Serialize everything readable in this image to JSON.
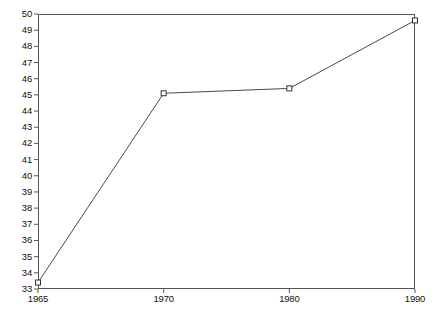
{
  "chart_data": {
    "type": "line",
    "title": "",
    "subtitle": "",
    "xlabel": "",
    "ylabel": "",
    "categories": [
      "1965",
      "1970",
      "1980",
      "1990"
    ],
    "x": [
      1965,
      1970,
      1980,
      1990
    ],
    "values": [
      33.4,
      45.1,
      45.4,
      49.6
    ],
    "series": [
      {
        "name": "",
        "values": [
          33.4,
          45.1,
          45.4,
          49.6
        ]
      }
    ],
    "ylim": [
      33,
      50
    ],
    "y_tick_labels": [
      "50",
      "49",
      "48",
      "47",
      "46",
      "45",
      "44",
      "43",
      "42",
      "41",
      "40",
      "39",
      "38",
      "37",
      "36",
      "35",
      "34",
      "33"
    ],
    "y_tick_values": [
      50,
      49,
      48,
      47,
      46,
      45,
      44,
      43,
      42,
      41,
      40,
      39,
      38,
      37,
      36,
      35,
      34,
      33
    ],
    "x_tick_labels": [
      "1965",
      "1970",
      "1980",
      "1990"
    ],
    "x_axis_scale": "categorical",
    "grid": false,
    "legend": false,
    "legend_position": "none",
    "marker": "open-square",
    "annotations": []
  },
  "style": {
    "line_color": "#4a4a4a",
    "marker_edge_color": "#333333",
    "marker_face_color": "#ffffff",
    "axis_color": "#565656",
    "text_color": "#111111",
    "background_color": "#ffffff"
  }
}
